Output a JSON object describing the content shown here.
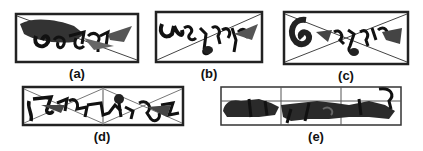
{
  "figure": {
    "panels": [
      {
        "id": "a",
        "caption": "(a)",
        "description": "Word image with single diagonal line"
      },
      {
        "id": "b",
        "caption": "(b)",
        "description": "Word image with single diagonal line (bottom-left to top-right)"
      },
      {
        "id": "c",
        "caption": "(c)",
        "description": "Word image with both diagonals (X)"
      },
      {
        "id": "d",
        "caption": "(d)",
        "description": "Word image split into two cells with diagonals"
      },
      {
        "id": "e",
        "caption": "(e)",
        "description": "Word image split into 3x2 grid cells"
      }
    ]
  }
}
